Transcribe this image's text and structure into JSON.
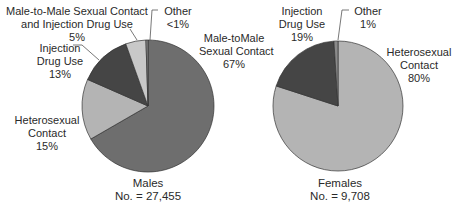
{
  "chart_data": [
    {
      "type": "pie",
      "title": "Males",
      "subtitle": "No. = 27,455",
      "slices": [
        {
          "label": "Male-toMale Sexual Contact",
          "value": 67,
          "display": "67%",
          "color": "#6e6e6e"
        },
        {
          "label": "Heterosexual Contact",
          "value": 15,
          "display": "15%",
          "color": "#b4b4b4"
        },
        {
          "label": "Injection Drug Use",
          "value": 13,
          "display": "13%",
          "color": "#454545"
        },
        {
          "label": "Male-to-Male Sexual Contact and Injection Drug Use",
          "value": 5,
          "display": "5%",
          "color": "#c8c8c8"
        },
        {
          "label": "Other",
          "value": 0.5,
          "display": "<1%",
          "color": "#8a8a8a"
        }
      ]
    },
    {
      "type": "pie",
      "title": "Females",
      "subtitle": "No. = 9,708",
      "slices": [
        {
          "label": "Heterosexual Contact",
          "value": 80,
          "display": "80%",
          "color": "#b4b4b4"
        },
        {
          "label": "Injection Drug Use",
          "value": 19,
          "display": "19%",
          "color": "#454545"
        },
        {
          "label": "Other",
          "value": 1,
          "display": "1%",
          "color": "#8a8a8a"
        }
      ]
    }
  ],
  "males": {
    "title": "Males",
    "count": "No. = 27,455",
    "labels": {
      "msm_line1": "Male-toMale",
      "msm_line2": "Sexual Contact",
      "msm_pct": "67%",
      "het_line1": "Heterosexual",
      "het_line2": "Contact",
      "het_pct": "15%",
      "idu_line1": "Injection",
      "idu_line2": "Drug Use",
      "idu_pct": "13%",
      "msmidu_line1": "Male-to-Male Sexual Contact",
      "msmidu_line2": "and Injection Drug Use",
      "msmidu_pct": "5%",
      "other_line1": "Other",
      "other_pct": "<1%"
    }
  },
  "females": {
    "title": "Females",
    "count": "No. = 9,708",
    "labels": {
      "het_line1": "Heterosexual",
      "het_line2": "Contact",
      "het_pct": "80%",
      "idu_line1": "Injection",
      "idu_line2": "Drug Use",
      "idu_pct": "19%",
      "other_line1": "Other",
      "other_pct": "1%"
    }
  }
}
